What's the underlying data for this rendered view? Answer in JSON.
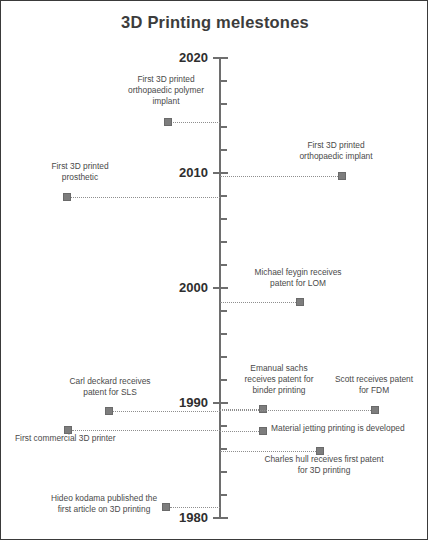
{
  "title": "3D Printing melestones",
  "axis": {
    "top_year": 2020,
    "bottom_year": 1980,
    "decade_labels": [
      "2020",
      "2010",
      "2000",
      "1990",
      "1980"
    ]
  },
  "chart_data": {
    "type": "timeline",
    "title": "3D Printing melestones",
    "orientation": "vertical",
    "axis_label": "Year",
    "ylim": [
      1980,
      2020
    ],
    "yticks": [
      2020,
      2010,
      2000,
      1990,
      1980
    ],
    "tick_interval_years": 2,
    "grid": false,
    "legend": "none",
    "marker_color": "#7d7d7d",
    "axis_color": "#6e6e6e",
    "title_color": "#3c3c3c",
    "events": [
      {
        "label": "First 3D printed\northopaedic polymer\nimplant",
        "year": 2014.8,
        "side": "left"
      },
      {
        "label": "First 3D printed\northopaedic implant",
        "year": 2010,
        "side": "right"
      },
      {
        "label": "First 3D printed\nprosthetic",
        "year": 2008.2,
        "side": "left"
      },
      {
        "label": "Michael feygin receives\npatent for LOM",
        "year": 1999.1,
        "side": "right"
      },
      {
        "label": "Emanual sachs\nreceives patent for\nbinder printing",
        "year": 1990.2,
        "side": "right"
      },
      {
        "label": "Carl deckard receives\npatent for SLS",
        "year": 1990,
        "side": "left"
      },
      {
        "label": "Scott receives patent\nfor FDM",
        "year": 1990,
        "side": "right"
      },
      {
        "label": "Material jetting printing is developed",
        "year": 1988.2,
        "side": "right"
      },
      {
        "label": "First commercial 3D printer",
        "year": 1988.3,
        "side": "left"
      },
      {
        "label": "Charles hull receives first patent\nfor 3D printing",
        "year": 1986.5,
        "side": "right"
      },
      {
        "label": "Hideo kodama published the\nfirst article on 3D printing",
        "year": 1981.3,
        "side": "left"
      }
    ]
  },
  "milestones": [
    {
      "id": "orthopaedic-polymer-implant",
      "text": "First 3D printed\northopaedic polymer\nimplant",
      "marker_x": 163,
      "marker_y": 117,
      "conn_x": 167,
      "conn_w": 52,
      "label_x": 97,
      "label_y": 73,
      "label_w": 136,
      "align": "center"
    },
    {
      "id": "orthopaedic-implant",
      "text": "First 3D printed\northopaedic implant",
      "marker_x": 337,
      "marker_y": 171,
      "conn_x": 219,
      "conn_w": 118,
      "label_x": 272,
      "label_y": 139,
      "label_w": 126,
      "align": "center"
    },
    {
      "id": "prosthetic",
      "text": "First 3D printed\nprosthetic",
      "marker_x": 62,
      "marker_y": 192,
      "conn_x": 70,
      "conn_w": 149,
      "label_x": 16,
      "label_y": 160,
      "label_w": 126,
      "align": "center"
    },
    {
      "id": "feygin-lom",
      "text": "Michael feygin receives\npatent for LOM",
      "marker_x": 295,
      "marker_y": 297,
      "conn_x": 219,
      "conn_w": 76,
      "label_x": 234,
      "label_y": 266,
      "label_w": 126,
      "align": "center"
    },
    {
      "id": "sachs-binder-printing",
      "text": "Emanual sachs\nreceives patent for\nbinder printing",
      "marker_x": 258,
      "marker_y": 404,
      "conn_x": 219,
      "conn_w": 39,
      "label_x": 215,
      "label_y": 362,
      "label_w": 126,
      "align": "center"
    },
    {
      "id": "deckard-sls",
      "text": "Carl deckard receives\npatent for SLS",
      "marker_x": 104,
      "marker_y": 406,
      "conn_x": 112,
      "conn_w": 107,
      "label_x": 46,
      "label_y": 375,
      "label_w": 126,
      "align": "center"
    },
    {
      "id": "scott-fdm",
      "text": "Scott receives patent\nfor FDM",
      "marker_x": 370,
      "marker_y": 405,
      "conn_x": 219,
      "conn_w": 151,
      "label_x": 322,
      "label_y": 373,
      "label_w": 102,
      "align": "center"
    },
    {
      "id": "material-jetting",
      "text": "Material jetting printing is developed",
      "marker_x": 258,
      "marker_y": 426,
      "conn_x": 219,
      "conn_w": 39,
      "label_x": 270,
      "label_y": 422,
      "label_w": 150,
      "align": "left"
    },
    {
      "id": "first-commercial-printer",
      "text": "First commercial 3D printer",
      "marker_x": 63,
      "marker_y": 425,
      "conn_x": 71,
      "conn_w": 148,
      "label_x": 14,
      "label_y": 432,
      "label_w": 126,
      "align": "left"
    },
    {
      "id": "hull-first-patent",
      "text": "Charles hull receives first patent\nfor 3D printing",
      "marker_x": 315,
      "marker_y": 446,
      "conn_x": 219,
      "conn_w": 96,
      "label_x": 250,
      "label_y": 453,
      "label_w": 146,
      "align": "center"
    },
    {
      "id": "kodama-first-article",
      "text": "Hideo kodama published the\nfirst article on 3D printing",
      "marker_x": 161,
      "marker_y": 502,
      "conn_x": 169,
      "conn_w": 50,
      "label_x": 44,
      "label_y": 492,
      "label_w": 118,
      "align": "center"
    }
  ]
}
